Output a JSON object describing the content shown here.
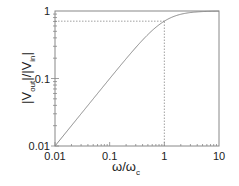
{
  "chart_data": {
    "type": "line",
    "title": "",
    "xlabel": "ω/ω_c",
    "ylabel": "|V_out|/|V_in|",
    "xlabel_parts": {
      "main": "ω/ω",
      "sub": "c"
    },
    "ylabel_parts": {
      "p1": "|V",
      "sub1": "out",
      "p2": "|/|V",
      "sub2": "in",
      "p3": "|"
    },
    "xscale": "log",
    "yscale": "log",
    "xlim": [
      0.01,
      10
    ],
    "ylim": [
      0.01,
      1
    ],
    "x_ticks": [
      {
        "value": 0.01,
        "label": "0.01"
      },
      {
        "value": 0.1,
        "label": "0.1"
      },
      {
        "value": 1,
        "label": "1"
      },
      {
        "value": 10,
        "label": "10"
      }
    ],
    "y_ticks": [
      {
        "value": 0.01,
        "label": "0.01"
      },
      {
        "value": 0.1,
        "label": "0.1"
      },
      {
        "value": 1,
        "label": "1"
      }
    ],
    "grid": false,
    "legend": null,
    "series": [
      {
        "name": "first-order high-pass response",
        "formula": "x / sqrt(1 + x^2)",
        "x": [
          0.01,
          0.02,
          0.05,
          0.1,
          0.2,
          0.5,
          1,
          2,
          5,
          10
        ],
        "values": [
          0.01,
          0.02,
          0.05,
          0.0995,
          0.196,
          0.447,
          0.707,
          0.894,
          0.981,
          0.995
        ],
        "style": "solid",
        "color": "#888888"
      }
    ],
    "annotations": [
      {
        "type": "dashed-hline",
        "y": 0.707,
        "x_from": 0.01,
        "x_to": 1,
        "color": "#888888"
      },
      {
        "type": "dashed-vline",
        "x": 1,
        "y_from": 0.01,
        "y_to": 0.707,
        "color": "#888888"
      }
    ],
    "colors": {
      "frame": "#888888",
      "curve": "#888888",
      "text": "#222222"
    }
  }
}
